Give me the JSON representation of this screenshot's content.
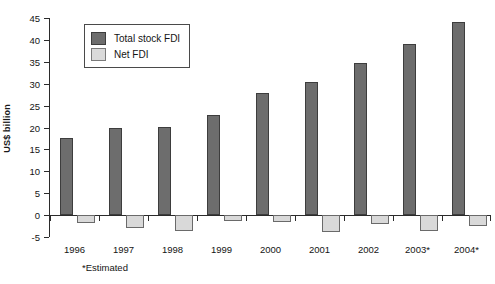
{
  "chart_data": {
    "type": "bar",
    "title": "",
    "subtitle": "",
    "xlabel": "",
    "ylabel": "US$ billion",
    "ylim": [
      -5,
      45
    ],
    "ytick_step": 5,
    "yticks": [
      45,
      40,
      35,
      30,
      25,
      20,
      15,
      10,
      5,
      0,
      -5
    ],
    "ytick_labels": [
      "45",
      "40",
      "35",
      "30",
      "25",
      "20",
      "15",
      "10",
      "5",
      "0",
      "-5"
    ],
    "grid": false,
    "legend_position": "upper-left-inside",
    "categories": [
      "1996",
      "1997",
      "1998",
      "1999",
      "2000",
      "2001",
      "2002",
      "2003*",
      "2004*"
    ],
    "series": [
      {
        "name": "Total stock FDI",
        "color": "#6d6d6d",
        "values": [
          17.7,
          19.8,
          20.1,
          22.9,
          27.9,
          30.4,
          34.7,
          39.0,
          44.0
        ]
      },
      {
        "name": "Net FDI",
        "color": "#d9d9d9",
        "values": [
          -1.8,
          -3.0,
          -3.7,
          -1.3,
          -1.6,
          -3.9,
          -2.0,
          -3.6,
          -2.6
        ]
      }
    ],
    "annotations": [
      "*Estimated"
    ]
  },
  "axes": {
    "y_title": "US$ billion"
  },
  "legend": {
    "entries": [
      {
        "label": "Total stock FDI",
        "swatch": "dark-gray-swatch"
      },
      {
        "label": "Net FDI",
        "swatch": "light-gray-swatch"
      }
    ]
  },
  "footnote": {
    "text": "*Estimated"
  }
}
